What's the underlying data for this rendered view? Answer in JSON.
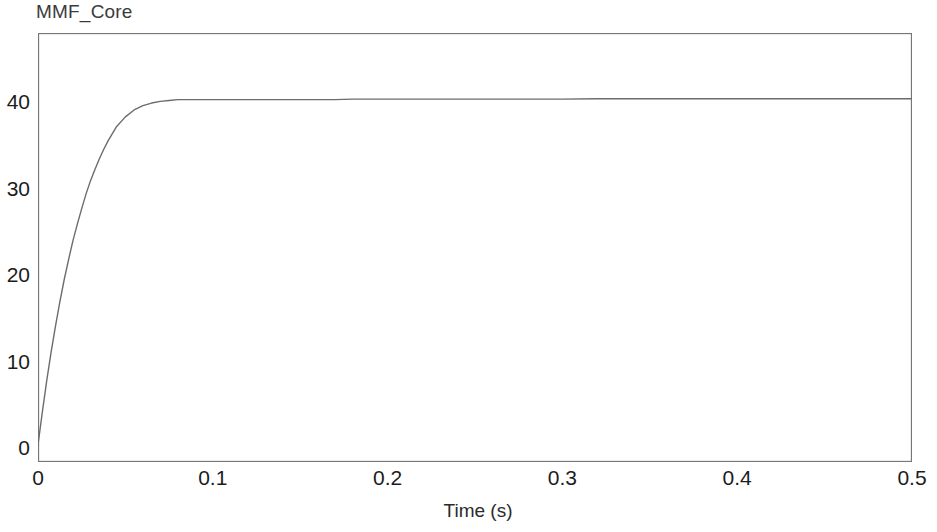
{
  "chart_data": {
    "type": "line",
    "title": "MMF_Core",
    "xlabel": "Time (s)",
    "ylabel": "",
    "xlim": [
      0,
      0.5
    ],
    "ylim": [
      -1.6,
      48.0
    ],
    "xticks": [
      "0",
      "0.1",
      "0.2",
      "0.3",
      "0.4",
      "0.5"
    ],
    "xtick_values": [
      0,
      0.1,
      0.2,
      0.3,
      0.4,
      0.5
    ],
    "yticks": [
      "0",
      "10",
      "20",
      "30",
      "40"
    ],
    "ytick_values": [
      0,
      10,
      20,
      30,
      40
    ],
    "grid": false,
    "legend": false,
    "series": [
      {
        "name": "MMF_Core",
        "color": "#6c6c6c",
        "steady_state": 40.4,
        "x": [
          0.0,
          0.0025,
          0.005,
          0.0075,
          0.01,
          0.0125,
          0.015,
          0.0175,
          0.02,
          0.0225,
          0.025,
          0.0275,
          0.03,
          0.0325,
          0.035,
          0.0375,
          0.04,
          0.045,
          0.05,
          0.055,
          0.06,
          0.065,
          0.07,
          0.075,
          0.08,
          0.085,
          0.09,
          0.095,
          0.1,
          0.11,
          0.12,
          0.13,
          0.14,
          0.15,
          0.16,
          0.17,
          0.18,
          0.19,
          0.2,
          0.22,
          0.24,
          0.26,
          0.28,
          0.3,
          0.32,
          0.34,
          0.36,
          0.38,
          0.4,
          0.42,
          0.44,
          0.46,
          0.48,
          0.5
        ],
        "y": [
          0.4,
          4.2,
          7.8,
          11.1,
          14.1,
          16.9,
          19.5,
          21.8,
          24.0,
          25.9,
          27.7,
          29.4,
          30.9,
          32.2,
          33.4,
          34.5,
          35.5,
          37.2,
          38.3,
          39.1,
          39.6,
          39.9,
          40.1,
          40.2,
          40.3,
          40.3,
          40.3,
          40.3,
          40.3,
          40.3,
          40.3,
          40.3,
          40.3,
          40.3,
          40.3,
          40.3,
          40.35,
          40.35,
          40.35,
          40.35,
          40.35,
          40.35,
          40.35,
          40.35,
          40.4,
          40.4,
          40.4,
          40.4,
          40.4,
          40.4,
          40.4,
          40.4,
          40.4,
          40.4
        ]
      }
    ],
    "axis_color": "#777777",
    "line_width": 1.4
  }
}
